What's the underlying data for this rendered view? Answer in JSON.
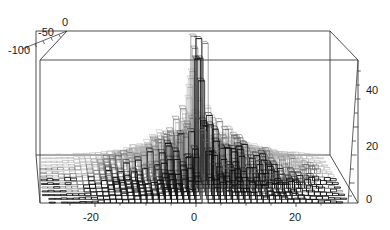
{
  "figure": {
    "kind": "3d-bar-histogram",
    "background": "#ffffff",
    "line_color": "#3a3a3a",
    "bar_stroke_dark": "#111111",
    "bar_stroke_mid": "#666666",
    "bar_stroke_light": "#b0b0b0",
    "bar_fill": "none"
  },
  "axes": {
    "x": {
      "label": "",
      "ticks": [
        "-20",
        "0",
        "20"
      ],
      "tick_values": [
        -20,
        0,
        20
      ],
      "range": [
        -27,
        25
      ]
    },
    "y": {
      "label": "",
      "ticks": [
        "-100",
        "-50",
        "0"
      ],
      "tick_values": [
        -100,
        -50,
        0
      ],
      "range": [
        -115,
        8
      ]
    },
    "z": {
      "label": "",
      "ticks": [
        "0",
        "20",
        "40"
      ],
      "tick_values": [
        0,
        20,
        40
      ],
      "range": [
        0,
        52
      ]
    }
  },
  "chart_data": {
    "type": "bar",
    "title": "",
    "xlabel": "",
    "ylabel": "",
    "zlabel": "",
    "xlim": [
      -27,
      25
    ],
    "ylim": [
      -115,
      8
    ],
    "zlim": [
      0,
      52
    ],
    "xticks": [
      -20,
      0,
      20
    ],
    "yticks": [
      -100,
      -50,
      0
    ],
    "zticks": [
      0,
      20,
      40
    ],
    "grid": false,
    "legend": "none",
    "annotations": [
      "central spike at x=0 reaching about 58"
    ],
    "x": [
      -26,
      -25,
      -24,
      -23,
      -22,
      -21,
      -20,
      -19,
      -18,
      -17,
      -16,
      -15,
      -14,
      -13,
      -12,
      -11,
      -10,
      -9,
      -8,
      -7,
      -6,
      -5,
      -4,
      -3,
      -2,
      -1,
      0,
      1,
      2,
      3,
      4,
      5,
      6,
      7,
      8,
      9,
      10,
      11,
      12,
      13,
      14,
      15,
      16,
      17,
      18,
      19,
      20,
      21,
      22,
      23
    ],
    "values": [
      0.6,
      0.8,
      0.7,
      1.0,
      1.2,
      1.1,
      1.6,
      2.0,
      2.4,
      2.9,
      3.4,
      4.0,
      4.6,
      5.4,
      6.2,
      7.1,
      8.2,
      9.4,
      10.6,
      12.0,
      13.4,
      15.0,
      16.8,
      19.0,
      22.0,
      27.0,
      58.0,
      33.0,
      24.0,
      20.0,
      18.0,
      16.4,
      15.0,
      13.6,
      12.4,
      11.2,
      10.2,
      9.2,
      8.2,
      7.4,
      6.6,
      5.8,
      5.1,
      4.4,
      3.8,
      3.2,
      2.6,
      2.0,
      1.4,
      0.9
    ],
    "series": [
      {
        "name": "histogram",
        "values": [
          0.6,
          0.8,
          0.7,
          1.0,
          1.2,
          1.1,
          1.6,
          2.0,
          2.4,
          2.9,
          3.4,
          4.0,
          4.6,
          5.4,
          6.2,
          7.1,
          8.2,
          9.4,
          10.6,
          12.0,
          13.4,
          15.0,
          16.8,
          19.0,
          22.0,
          27.0,
          58.0,
          33.0,
          24.0,
          20.0,
          18.0,
          16.4,
          15.0,
          13.6,
          12.4,
          11.2,
          10.2,
          9.2,
          8.2,
          7.4,
          6.6,
          5.8,
          5.1,
          4.4,
          3.8,
          3.2,
          2.6,
          2.0,
          1.4,
          0.9
        ]
      }
    ],
    "depth_rows": 14,
    "row_profile": [
      0.3,
      0.4,
      0.5,
      0.6,
      0.7,
      0.8,
      0.9,
      1.0,
      0.95,
      0.86,
      0.74,
      0.6,
      0.45,
      0.3
    ]
  }
}
